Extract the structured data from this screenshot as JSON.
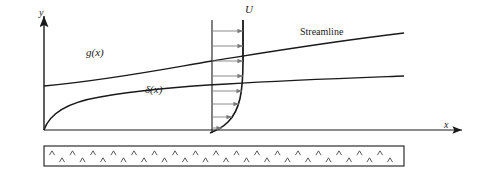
{
  "figure": {
    "background_color": "#ffffff",
    "line_color": "#1a1a1a",
    "arrow_color": "#808080"
  },
  "axes": {
    "y_label": "y",
    "x_label": "x",
    "origin": {
      "x": 44,
      "y": 130
    },
    "y_axis_top": 14,
    "x_axis_right": 466
  },
  "labels": {
    "freestream": "U",
    "outer_streamline_curve": "g(x)",
    "boundary_layer_thickness": "δ(x)",
    "streamline_text": "Streamline"
  },
  "curves": {
    "streamline_g": {
      "name": "g(x)",
      "description": "Gently rising outer streamline from left wall to right edge",
      "path": "M 44,86 C 110,80 170,68 212,61 C 250,55 320,43 404,33"
    },
    "boundary_layer_delta": {
      "name": "δ(x)",
      "description": "Boundary layer edge growing as square root of x from the origin",
      "path": "M 44,130 C 50,112 70,102 100,97 C 140,90 190,86 227,84 C 290,80 350,78 404,76"
    },
    "velocity_profile": {
      "name": "u(y) profile",
      "description": "Parabolic-like velocity profile curve at the measurement station, tangent to the wall",
      "path": "M 243,20 L 243,60 C 243,92 240,110 228,122 C 222,128 215,131 210,133"
    }
  },
  "velocity_station": {
    "left_line_x": 212,
    "right_line_x": 243,
    "top_y": 20,
    "bottom_y": 133,
    "arrows": [
      {
        "y": 31,
        "x_start": 212,
        "x_end": 243
      },
      {
        "y": 46,
        "x_start": 212,
        "x_end": 243
      },
      {
        "y": 61,
        "x_start": 212,
        "x_end": 243
      },
      {
        "y": 76,
        "x_start": 212,
        "x_end": 243
      },
      {
        "y": 91,
        "x_start": 212,
        "x_end": 242
      },
      {
        "y": 104,
        "x_start": 212,
        "x_end": 239
      },
      {
        "y": 117,
        "x_start": 212,
        "x_end": 232
      },
      {
        "y": 128,
        "x_start": 212,
        "x_end": 222
      }
    ]
  },
  "wall": {
    "left": 44,
    "right": 404,
    "top": 146,
    "bottom": 166,
    "hatch_rows": [
      {
        "y": 153,
        "x_start": 52,
        "spacing": 20.5,
        "count": 18
      },
      {
        "y": 160,
        "x_start": 62,
        "spacing": 20.5,
        "count": 17
      }
    ]
  }
}
